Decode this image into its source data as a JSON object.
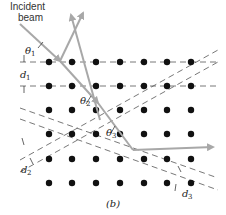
{
  "figure": {
    "caption": "(b)",
    "beam_label_line1": "Incident",
    "beam_label_line2": "beam",
    "angles": [
      {
        "symbol": "θ",
        "sub": "1"
      },
      {
        "symbol": "θ",
        "sub": "2"
      },
      {
        "symbol": "θ",
        "sub": "3"
      }
    ],
    "spacings": [
      {
        "symbol": "d",
        "sub": "1"
      },
      {
        "symbol": "d",
        "sub": "2"
      },
      {
        "symbol": "d",
        "sub": "3"
      }
    ],
    "colors": {
      "beam": "#a8a8a8",
      "atoms": "#111111",
      "planes": "#555555",
      "background": "#ffffff"
    },
    "lattice": {
      "columns_x": [
        49,
        72,
        96,
        120,
        144,
        167,
        191
      ],
      "rows_y": [
        62,
        86,
        110,
        134,
        159,
        183
      ]
    }
  }
}
